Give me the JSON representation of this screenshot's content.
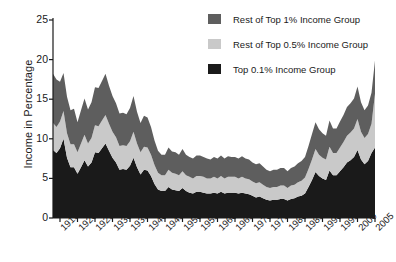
{
  "chart_data": {
    "type": "area",
    "stacked": true,
    "title": "",
    "xlabel": "",
    "ylabel": "Income in Percentage",
    "xlim": [
      1913,
      2005
    ],
    "ylim": [
      0,
      25
    ],
    "yticks": [
      0,
      5,
      10,
      15,
      20,
      25
    ],
    "xticks": [
      1915,
      1920,
      1925,
      1930,
      1935,
      1940,
      1945,
      1950,
      1955,
      1960,
      1965,
      1970,
      1975,
      1980,
      1985,
      1990,
      1995,
      2000,
      2005
    ],
    "grid": false,
    "legend_position": "top-right",
    "colors": {
      "rest_of_top_1": "#5e5e5e",
      "rest_of_top_05": "#c9c9c9",
      "top_01": "#1a1a1a",
      "axis": "#1a1a1a",
      "background": "#ffffff"
    },
    "x": [
      1913,
      1914,
      1915,
      1916,
      1917,
      1918,
      1919,
      1920,
      1921,
      1922,
      1923,
      1924,
      1925,
      1926,
      1927,
      1928,
      1929,
      1930,
      1931,
      1932,
      1933,
      1934,
      1935,
      1936,
      1937,
      1938,
      1939,
      1940,
      1941,
      1942,
      1943,
      1944,
      1945,
      1946,
      1947,
      1948,
      1949,
      1950,
      1951,
      1952,
      1953,
      1954,
      1955,
      1956,
      1957,
      1958,
      1959,
      1960,
      1961,
      1962,
      1963,
      1964,
      1965,
      1966,
      1967,
      1968,
      1969,
      1970,
      1971,
      1972,
      1973,
      1974,
      1975,
      1976,
      1977,
      1978,
      1979,
      1980,
      1981,
      1982,
      1983,
      1984,
      1985,
      1986,
      1987,
      1988,
      1989,
      1990,
      1991,
      1992,
      1993,
      1994,
      1995,
      1996,
      1997,
      1998,
      1999,
      2000,
      2001,
      2002,
      2003,
      2004,
      2005
    ],
    "series": [
      {
        "name": "Top 0.1% Income Group",
        "key": "top_01",
        "color": "#1a1a1a",
        "values": [
          8.6,
          8.2,
          8.8,
          10.0,
          7.6,
          6.4,
          6.4,
          5.6,
          6.4,
          7.3,
          6.5,
          7.0,
          8.3,
          8.2,
          8.8,
          9.4,
          8.5,
          7.6,
          7.0,
          6.1,
          6.2,
          6.1,
          6.6,
          7.6,
          6.4,
          5.5,
          6.1,
          6.0,
          5.3,
          4.3,
          3.6,
          3.4,
          3.4,
          3.9,
          3.6,
          3.5,
          3.4,
          3.8,
          3.4,
          3.2,
          3.1,
          3.3,
          3.3,
          3.2,
          3.1,
          3.1,
          3.2,
          3.1,
          3.3,
          3.1,
          3.2,
          3.2,
          3.2,
          3.1,
          3.2,
          3.1,
          3.0,
          2.8,
          2.6,
          2.7,
          2.5,
          2.3,
          2.2,
          2.3,
          2.3,
          2.4,
          2.4,
          2.2,
          2.4,
          2.5,
          2.7,
          2.8,
          3.1,
          3.9,
          4.8,
          5.8,
          5.3,
          5.0,
          4.8,
          6.0,
          5.4,
          5.4,
          5.9,
          6.4,
          7.0,
          7.3,
          7.7,
          8.6,
          7.4,
          6.8,
          7.2,
          8.2,
          8.9
        ]
      },
      {
        "name": "Rest of Top 0.5% Income Group",
        "key": "rest_of_top_05",
        "color": "#c9c9c9",
        "values": [
          3.4,
          3.3,
          3.4,
          3.5,
          3.1,
          2.9,
          2.9,
          2.7,
          3.0,
          3.2,
          2.9,
          3.1,
          3.4,
          3.4,
          3.5,
          3.6,
          3.4,
          3.3,
          3.2,
          3.0,
          3.0,
          3.0,
          3.1,
          3.3,
          3.0,
          2.8,
          2.9,
          2.9,
          2.7,
          2.4,
          2.1,
          2.0,
          2.0,
          2.2,
          2.1,
          2.1,
          2.0,
          2.1,
          2.0,
          2.0,
          1.9,
          2.0,
          2.0,
          2.0,
          1.9,
          1.9,
          2.0,
          1.9,
          2.0,
          1.9,
          2.0,
          2.0,
          2.0,
          1.9,
          2.0,
          1.9,
          1.9,
          1.8,
          1.8,
          1.8,
          1.7,
          1.6,
          1.6,
          1.6,
          1.6,
          1.7,
          1.7,
          1.6,
          1.7,
          1.7,
          1.8,
          1.9,
          2.0,
          2.3,
          2.6,
          2.9,
          2.7,
          2.6,
          2.6,
          3.0,
          2.8,
          2.8,
          3.0,
          3.2,
          3.4,
          3.5,
          3.6,
          3.9,
          3.5,
          3.3,
          3.4,
          3.7,
          6.8
        ]
      },
      {
        "name": "Rest of Top 1% Income Group",
        "key": "rest_of_top_1",
        "color": "#5e5e5e",
        "values": [
          6.2,
          6.0,
          5.0,
          4.8,
          4.6,
          4.3,
          4.5,
          3.8,
          4.2,
          4.6,
          4.3,
          4.5,
          4.8,
          4.8,
          5.0,
          5.2,
          4.8,
          4.5,
          4.3,
          4.1,
          4.1,
          4.0,
          4.2,
          4.5,
          4.0,
          3.7,
          3.9,
          3.8,
          3.5,
          3.1,
          2.8,
          2.6,
          2.6,
          2.8,
          2.7,
          2.7,
          2.6,
          2.8,
          2.6,
          2.5,
          2.5,
          2.6,
          2.6,
          2.5,
          2.5,
          2.4,
          2.5,
          2.5,
          2.6,
          2.5,
          2.6,
          2.5,
          2.5,
          2.5,
          2.6,
          2.5,
          2.5,
          2.4,
          2.4,
          2.4,
          2.3,
          2.2,
          2.1,
          2.2,
          2.2,
          2.2,
          2.2,
          2.1,
          2.2,
          2.3,
          2.4,
          2.5,
          2.6,
          2.9,
          3.2,
          3.4,
          3.2,
          3.1,
          3.0,
          3.3,
          3.1,
          3.1,
          3.3,
          3.4,
          3.6,
          3.7,
          3.8,
          4.1,
          3.7,
          3.5,
          3.6,
          3.9,
          4.2
        ]
      }
    ]
  },
  "legend": {
    "items": [
      {
        "label": "Rest of Top 1% Income Group",
        "color": "#5e5e5e",
        "swatch_name": "legend-swatch-rest-of-top-1"
      },
      {
        "label": "Rest of Top 0.5% Income Group",
        "color": "#c9c9c9",
        "swatch_name": "legend-swatch-rest-of-top-05"
      },
      {
        "label": "Top 0.1% Income Group",
        "color": "#1a1a1a",
        "swatch_name": "legend-swatch-top-01"
      }
    ]
  }
}
